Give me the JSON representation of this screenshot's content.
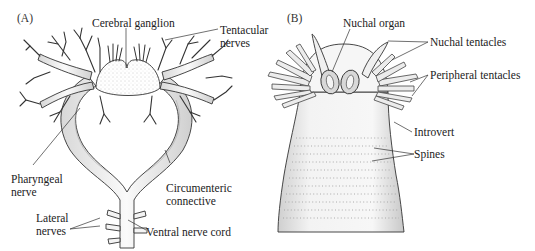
{
  "panels": [
    {
      "id": "A",
      "label": "(A)",
      "annotations": {
        "cerebral_ganglion": "Cerebral ganglion",
        "tentacular_nerves_1": "Tentacular",
        "tentacular_nerves_2": "nerves",
        "pharyngeal_nerve_1": "Pharyngeal",
        "pharyngeal_nerve_2": "nerve",
        "circumenteric_1": "Circumenteric",
        "circumenteric_2": "connective",
        "lateral_nerves_1": "Lateral",
        "lateral_nerves_2": "nerves",
        "ventral_nerve_cord": "Ventral nerve cord"
      }
    },
    {
      "id": "B",
      "label": "(B)",
      "annotations": {
        "nuchal_organ": "Nuchal organ",
        "nuchal_tentacles": "Nuchal tentacles",
        "peripheral_tentacles": "Peripheral tentacles",
        "introvert": "Introvert",
        "spines": "Spines"
      }
    }
  ]
}
